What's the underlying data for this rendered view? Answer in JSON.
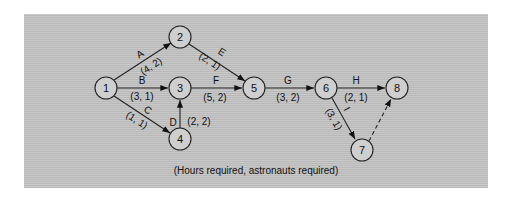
{
  "diagram": {
    "type": "activity-on-arrow network",
    "background_color": "#c0c0c0",
    "nodes": [
      {
        "id": "1",
        "label": "1",
        "x": 106,
        "y": 88
      },
      {
        "id": "2",
        "label": "2",
        "x": 180,
        "y": 37
      },
      {
        "id": "3",
        "label": "3",
        "x": 180,
        "y": 88
      },
      {
        "id": "4",
        "label": "4",
        "x": 180,
        "y": 139
      },
      {
        "id": "5",
        "label": "5",
        "x": 254,
        "y": 88
      },
      {
        "id": "6",
        "label": "6",
        "x": 326,
        "y": 88
      },
      {
        "id": "7",
        "label": "7",
        "x": 362,
        "y": 150
      },
      {
        "id": "8",
        "label": "8",
        "x": 397,
        "y": 88
      }
    ],
    "edges": [
      {
        "activity": "A",
        "from": "1",
        "to": "2",
        "params": "(4, 2)"
      },
      {
        "activity": "B",
        "from": "1",
        "to": "3",
        "params": "(3, 1)"
      },
      {
        "activity": "C",
        "from": "1",
        "to": "4",
        "params": "(1, 1)"
      },
      {
        "activity": "D",
        "from": "4",
        "to": "3",
        "params": "(2, 2)"
      },
      {
        "activity": "E",
        "from": "2",
        "to": "5",
        "params": "(2, 1)"
      },
      {
        "activity": "F",
        "from": "3",
        "to": "5",
        "params": "(5, 2)"
      },
      {
        "activity": "G",
        "from": "5",
        "to": "6",
        "params": "(3, 2)"
      },
      {
        "activity": "H",
        "from": "6",
        "to": "8",
        "params": "(2, 1)"
      },
      {
        "activity": "I",
        "from": "6",
        "to": "7",
        "params": "(3, 1)"
      },
      {
        "activity": "",
        "from": "7",
        "to": "8",
        "params": "",
        "dummy": true
      }
    ],
    "caption": "(Hours required, astronauts required)"
  }
}
